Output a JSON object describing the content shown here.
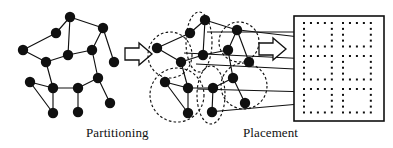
{
  "figure": {
    "stroke_color": "#101010",
    "node_color": "#101010",
    "dash_color": "#111111",
    "background": "#ffffff"
  },
  "labels": {
    "partitioning": "Partitioning",
    "placement": "Placement"
  },
  "stages": [
    {
      "name": "circuit-graph",
      "caption": ""
    },
    {
      "name": "partitioned-graph",
      "caption": "Partitioning"
    },
    {
      "name": "chip-placement",
      "caption": "Placement"
    }
  ],
  "chart_data": {
    "type": "diagram",
    "panels": [
      {
        "id": "circuit-graph",
        "label": "",
        "nodes": [
          {
            "id": "n1",
            "x": 70,
            "y": 17
          },
          {
            "id": "n2",
            "x": 56,
            "y": 33
          },
          {
            "id": "n3",
            "x": 103,
            "y": 28
          },
          {
            "id": "n4",
            "x": 23,
            "y": 50
          },
          {
            "id": "n5",
            "x": 68,
            "y": 55
          },
          {
            "id": "n6",
            "x": 46,
            "y": 62
          },
          {
            "id": "n7",
            "x": 92,
            "y": 50
          },
          {
            "id": "n8",
            "x": 114,
            "y": 62
          },
          {
            "id": "n9",
            "x": 98,
            "y": 78
          },
          {
            "id": "n10",
            "x": 78,
            "y": 88
          },
          {
            "id": "n11",
            "x": 53,
            "y": 88
          },
          {
            "id": "n12",
            "x": 30,
            "y": 82
          },
          {
            "id": "n13",
            "x": 53,
            "y": 113
          },
          {
            "id": "n14",
            "x": 78,
            "y": 112
          },
          {
            "id": "n15",
            "x": 110,
            "y": 103
          }
        ],
        "edges": [
          [
            "n1",
            "n2"
          ],
          [
            "n1",
            "n3"
          ],
          [
            "n1",
            "n5"
          ],
          [
            "n2",
            "n4"
          ],
          [
            "n4",
            "n6"
          ],
          [
            "n6",
            "n5"
          ],
          [
            "n5",
            "n7"
          ],
          [
            "n3",
            "n7"
          ],
          [
            "n3",
            "n8"
          ],
          [
            "n8",
            "n9"
          ],
          [
            "n7",
            "n9"
          ],
          [
            "n6",
            "n11"
          ],
          [
            "n9",
            "n10"
          ],
          [
            "n10",
            "n11"
          ],
          [
            "n11",
            "n12"
          ],
          [
            "n12",
            "n13"
          ],
          [
            "n11",
            "n13"
          ],
          [
            "n10",
            "n14"
          ],
          [
            "n9",
            "n15"
          ]
        ]
      },
      {
        "id": "partitioned-graph",
        "label": "Partitioning",
        "nodes": [
          {
            "id": "p1",
            "x": 205,
            "y": 20,
            "cluster": "c-top-mid"
          },
          {
            "id": "p2",
            "x": 190,
            "y": 33,
            "cluster": "c-top-mid"
          },
          {
            "id": "p3",
            "x": 237,
            "y": 30,
            "cluster": "c-top-right"
          },
          {
            "id": "p4",
            "x": 157,
            "y": 48,
            "cluster": "c-left"
          },
          {
            "id": "p5",
            "x": 203,
            "y": 55,
            "cluster": "c-top-mid"
          },
          {
            "id": "p6",
            "x": 181,
            "y": 62,
            "cluster": "c-left"
          },
          {
            "id": "p7",
            "x": 228,
            "y": 50,
            "cluster": "c-top-right"
          },
          {
            "id": "p8",
            "x": 249,
            "y": 62,
            "cluster": "c-top-right"
          },
          {
            "id": "p9",
            "x": 233,
            "y": 78,
            "cluster": "c-right"
          },
          {
            "id": "p10",
            "x": 213,
            "y": 88,
            "cluster": "c-mid-bottom"
          },
          {
            "id": "p11",
            "x": 188,
            "y": 88,
            "cluster": "c-bottom-left"
          },
          {
            "id": "p12",
            "x": 165,
            "y": 82,
            "cluster": "c-bottom-left"
          },
          {
            "id": "p13",
            "x": 188,
            "y": 113,
            "cluster": "c-bottom-left"
          },
          {
            "id": "p14",
            "x": 212,
            "y": 112,
            "cluster": "c-mid-bottom"
          },
          {
            "id": "p15",
            "x": 245,
            "y": 103,
            "cluster": "c-right"
          }
        ],
        "edges": [
          [
            "p1",
            "p2"
          ],
          [
            "p1",
            "p3"
          ],
          [
            "p1",
            "p5"
          ],
          [
            "p2",
            "p4"
          ],
          [
            "p4",
            "p6"
          ],
          [
            "p6",
            "p5"
          ],
          [
            "p5",
            "p7"
          ],
          [
            "p3",
            "p7"
          ],
          [
            "p3",
            "p8"
          ],
          [
            "p8",
            "p9"
          ],
          [
            "p7",
            "p9"
          ],
          [
            "p6",
            "p11"
          ],
          [
            "p9",
            "p10"
          ],
          [
            "p10",
            "p11"
          ],
          [
            "p11",
            "p12"
          ],
          [
            "p12",
            "p13"
          ],
          [
            "p11",
            "p13"
          ],
          [
            "p10",
            "p14"
          ],
          [
            "p9",
            "p15"
          ]
        ],
        "clusters": [
          {
            "id": "c-left",
            "cx": 170,
            "cy": 55,
            "rx": 22,
            "ry": 23
          },
          {
            "id": "c-top-mid",
            "cx": 199,
            "cy": 42,
            "rx": 13,
            "ry": 30
          },
          {
            "id": "c-top-right",
            "cx": 239,
            "cy": 42,
            "rx": 20,
            "ry": 20
          },
          {
            "id": "c-bottom-left",
            "cx": 177,
            "cy": 95,
            "rx": 27,
            "ry": 27
          },
          {
            "id": "c-mid-bottom",
            "cx": 211,
            "cy": 95,
            "rx": 14,
            "ry": 29
          },
          {
            "id": "c-right",
            "cx": 244,
            "cy": 86,
            "rx": 23,
            "ry": 23
          }
        ]
      },
      {
        "id": "chip-placement",
        "label": "Placement",
        "die": {
          "x": 294,
          "y": 16,
          "width": 90,
          "height": 105
        },
        "cell_blocks": 6,
        "block_grid": {
          "rows": 3,
          "cols": 2
        },
        "dot_grid_per_block": {
          "rows": 5,
          "cols": 5
        }
      }
    ],
    "flow_arrows": [
      {
        "from": "circuit-graph",
        "to": "partitioned-graph",
        "style": "hollow-block"
      },
      {
        "from": "partitioned-graph",
        "to": "chip-placement",
        "style": "hollow-block"
      }
    ],
    "mapping_arrows": 5
  }
}
